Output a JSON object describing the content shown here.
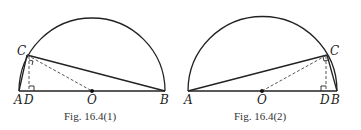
{
  "figures": [
    {
      "caption": "Fig.  16.4(1)",
      "labels": {
        "A": "A",
        "D": "D",
        "O": "O",
        "B": "B",
        "C": "C"
      },
      "points": {
        "A": [
          19,
          91
        ],
        "B": [
          165,
          91
        ],
        "O": [
          92,
          91
        ],
        "C": [
          27,
          55
        ],
        "D": [
          30,
          91
        ]
      },
      "radius": 73
    },
    {
      "caption": "Fig.  16.4(2)",
      "labels": {
        "A": "A",
        "O": "O",
        "D": "D",
        "B": "B",
        "C": "C"
      },
      "points": {
        "A": [
          188,
          91
        ],
        "B": [
          337,
          91
        ],
        "O": [
          262,
          91
        ],
        "C": [
          327,
          55
        ],
        "D": [
          326,
          91
        ]
      },
      "radius": 74
    }
  ]
}
